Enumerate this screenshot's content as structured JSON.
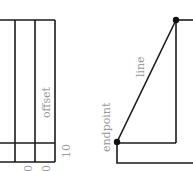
{
  "diagram": {
    "stroke_color": "#1a1a1a",
    "label_color": "#9a9a9a",
    "left_panel": {
      "labels": {
        "offset": "offset",
        "tick_10": "10",
        "bottom_a": "0",
        "bottom_b": "0"
      }
    },
    "right_panel": {
      "labels": {
        "line": "line",
        "endpoint": "endpoint"
      },
      "points": [
        {
          "name": "endpoint",
          "x": 117,
          "y": 142
        },
        {
          "name": "top",
          "x": 176,
          "y": 20
        }
      ]
    }
  }
}
